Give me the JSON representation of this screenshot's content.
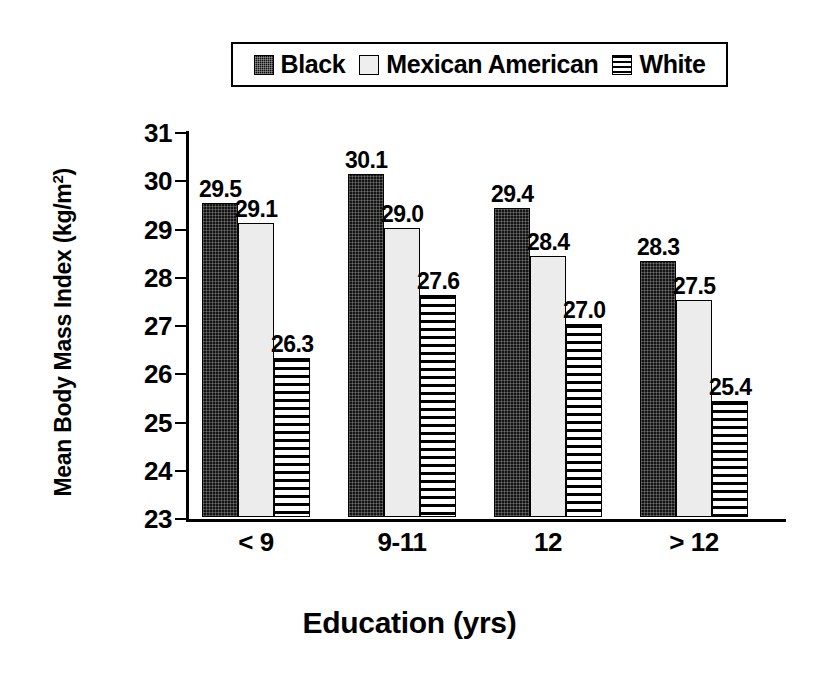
{
  "chart_data": {
    "type": "bar",
    "title": "",
    "xlabel": "Education (yrs)",
    "ylabel": "Mean Body Mass Index (kg/m",
    "ylabel_sup": "2",
    "ylabel_close": ")",
    "categories": [
      "< 9",
      "9-11",
      "12",
      "> 12"
    ],
    "ylim": [
      23,
      31
    ],
    "yticks": [
      31,
      30,
      29,
      28,
      27,
      26,
      25,
      24,
      23
    ],
    "ytick_labels": [
      "31",
      "30",
      "29",
      "28",
      "27",
      "26",
      "25",
      "24",
      "23"
    ],
    "grid": false,
    "legend_position": "top-center",
    "series": [
      {
        "name": "Black",
        "swatch": "solid-dark",
        "values": [
          29.5,
          30.1,
          29.4,
          28.3
        ],
        "labels": [
          "29.5",
          "30.1",
          "29.4",
          "28.3"
        ]
      },
      {
        "name": "Mexican American",
        "swatch": "light-gray",
        "values": [
          29.1,
          29.0,
          28.4,
          27.5
        ],
        "labels": [
          "29.1",
          "29.0",
          "28.4",
          "27.5"
        ]
      },
      {
        "name": "White",
        "swatch": "horizontal-stripes",
        "values": [
          26.3,
          27.6,
          27.0,
          25.4
        ],
        "labels": [
          "26.3",
          "27.6",
          "27.0",
          "25.4"
        ]
      }
    ]
  },
  "legend": {
    "entries": [
      {
        "label": "Black"
      },
      {
        "label": "Mexican American"
      },
      {
        "label": "White"
      }
    ]
  },
  "colors": {
    "series_black": "#141414",
    "series_mexican_american": "#ececec",
    "series_white": "#ffffff",
    "axis": "#000000",
    "background": "#ffffff"
  }
}
